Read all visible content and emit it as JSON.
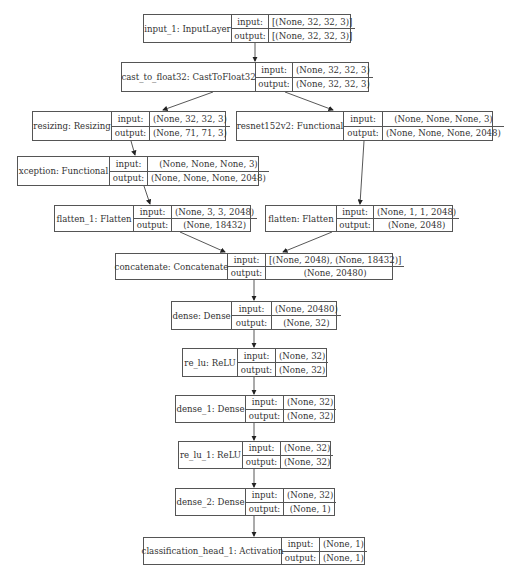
{
  "diagram": {
    "type": "keras-model-plot",
    "labels": {
      "input": "input:",
      "output": "output:"
    },
    "nodes": [
      {
        "id": "input_1",
        "name": "input_1: InputLayer",
        "input": "[(None, 32, 32, 3)]",
        "output": "[(None, 32, 32, 3)]"
      },
      {
        "id": "cast",
        "name": "cast_to_float32: CastToFloat32",
        "input": "(None, 32, 32, 3)",
        "output": "(None, 32, 32, 3)"
      },
      {
        "id": "resizing",
        "name": "resizing: Resizing",
        "input": "(None, 32, 32, 3)",
        "output": "(None, 71, 71, 3)"
      },
      {
        "id": "resnet",
        "name": "resnet152v2: Functional",
        "input": "(None, None, None, 3)",
        "output": "(None, None, None, 2048)"
      },
      {
        "id": "xception",
        "name": "xception: Functional",
        "input": "(None, None, None, 3)",
        "output": "(None, None, None, 2048)"
      },
      {
        "id": "flatten_1",
        "name": "flatten_1: Flatten",
        "input": "(None, 3, 3, 2048)",
        "output": "(None, 18432)"
      },
      {
        "id": "flatten",
        "name": "flatten: Flatten",
        "input": "(None, 1, 1, 2048)",
        "output": "(None, 2048)"
      },
      {
        "id": "concatenate",
        "name": "concatenate: Concatenate",
        "input": "[(None, 2048), (None, 18432)]",
        "output": "(None, 20480)"
      },
      {
        "id": "dense",
        "name": "dense: Dense",
        "input": "(None, 20480)",
        "output": "(None, 32)"
      },
      {
        "id": "re_lu",
        "name": "re_lu: ReLU",
        "input": "(None, 32)",
        "output": "(None, 32)"
      },
      {
        "id": "dense_1",
        "name": "dense_1: Dense",
        "input": "(None, 32)",
        "output": "(None, 32)"
      },
      {
        "id": "re_lu_1",
        "name": "re_lu_1: ReLU",
        "input": "(None, 32)",
        "output": "(None, 32)"
      },
      {
        "id": "dense_2",
        "name": "dense_2: Dense",
        "input": "(None, 32)",
        "output": "(None, 1)"
      },
      {
        "id": "classification_head_1",
        "name": "classification_head_1: Activation",
        "input": "(None, 1)",
        "output": "(None, 1)"
      }
    ],
    "edges": [
      [
        "input_1",
        "cast"
      ],
      [
        "cast",
        "resizing"
      ],
      [
        "cast",
        "resnet"
      ],
      [
        "resizing",
        "xception"
      ],
      [
        "xception",
        "flatten_1"
      ],
      [
        "resnet",
        "flatten"
      ],
      [
        "flatten_1",
        "concatenate"
      ],
      [
        "flatten",
        "concatenate"
      ],
      [
        "concatenate",
        "dense"
      ],
      [
        "dense",
        "re_lu"
      ],
      [
        "re_lu",
        "dense_1"
      ],
      [
        "dense_1",
        "re_lu_1"
      ],
      [
        "re_lu_1",
        "dense_2"
      ],
      [
        "dense_2",
        "classification_head_1"
      ]
    ]
  }
}
